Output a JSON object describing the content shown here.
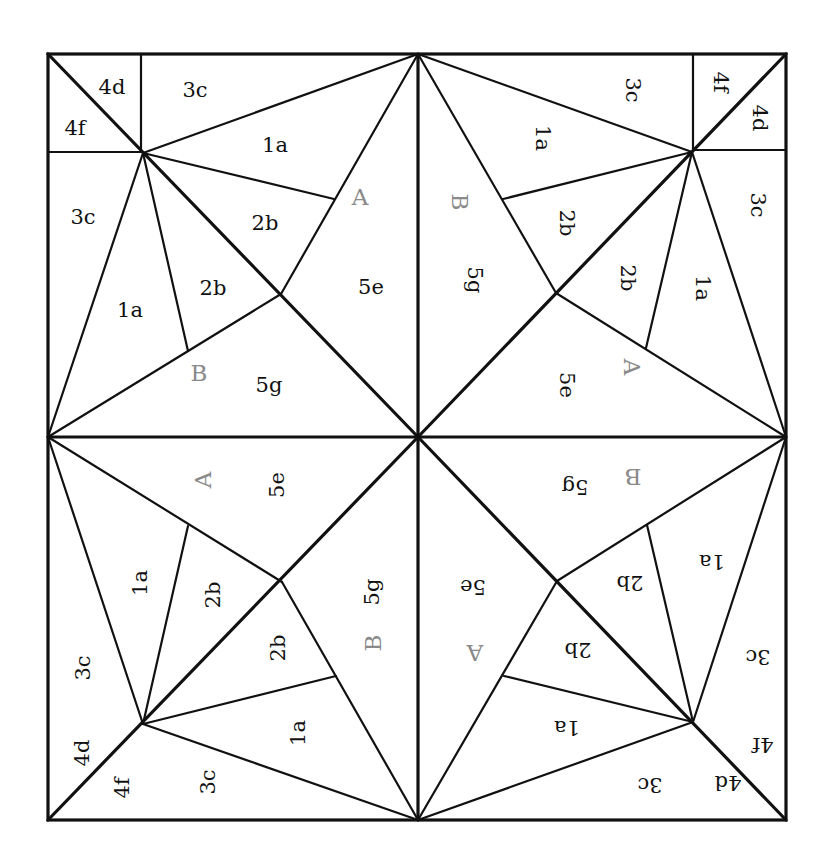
{
  "diagram": {
    "title": "",
    "colors": {
      "line": "#111111",
      "label": "#111111",
      "reference_label": "#8a8a8a",
      "background": "#ffffff"
    },
    "outer_square": {
      "left": 48,
      "top": 54,
      "right": 786,
      "bottom": 820
    },
    "center": [
      418,
      437
    ],
    "quadrants": [
      {
        "id": "top-left",
        "rotation": 0,
        "labels": [
          {
            "text": "4d",
            "x": 112,
            "y": 87
          },
          {
            "text": "4f",
            "x": 75,
            "y": 128
          },
          {
            "text": "3c",
            "x": 195,
            "y": 90
          },
          {
            "text": "1a",
            "x": 275,
            "y": 145
          },
          {
            "text": "A",
            "x": 360,
            "y": 197,
            "ref": true
          },
          {
            "text": "3c",
            "x": 83,
            "y": 217
          },
          {
            "text": "2b",
            "x": 265,
            "y": 223
          },
          {
            "text": "2b",
            "x": 213,
            "y": 288
          },
          {
            "text": "5e",
            "x": 371,
            "y": 287
          },
          {
            "text": "1a",
            "x": 130,
            "y": 310
          },
          {
            "text": "B",
            "x": 199,
            "y": 373,
            "ref": true
          },
          {
            "text": "5g",
            "x": 269,
            "y": 385
          }
        ]
      },
      {
        "id": "top-right",
        "rotation": 90,
        "labels": [
          {
            "text": "3c",
            "x": 633,
            "y": 90
          },
          {
            "text": "4f",
            "x": 721,
            "y": 82
          },
          {
            "text": "4d",
            "x": 760,
            "y": 118
          },
          {
            "text": "1a",
            "x": 543,
            "y": 138
          },
          {
            "text": "3c",
            "x": 758,
            "y": 205
          },
          {
            "text": "B",
            "x": 460,
            "y": 202,
            "ref": true
          },
          {
            "text": "2b",
            "x": 567,
            "y": 223
          },
          {
            "text": "5g",
            "x": 475,
            "y": 280
          },
          {
            "text": "2b",
            "x": 628,
            "y": 278
          },
          {
            "text": "1a",
            "x": 703,
            "y": 288
          },
          {
            "text": "A",
            "x": 632,
            "y": 367,
            "ref": true
          },
          {
            "text": "5e",
            "x": 567,
            "y": 385
          }
        ]
      },
      {
        "id": "bottom-left",
        "rotation": -90,
        "labels": [
          {
            "text": "A",
            "x": 203,
            "y": 480,
            "ref": true
          },
          {
            "text": "5e",
            "x": 277,
            "y": 485
          },
          {
            "text": "1a",
            "x": 140,
            "y": 583
          },
          {
            "text": "2b",
            "x": 213,
            "y": 595
          },
          {
            "text": "5g",
            "x": 372,
            "y": 592
          },
          {
            "text": "B",
            "x": 373,
            "y": 643,
            "ref": true
          },
          {
            "text": "2b",
            "x": 278,
            "y": 648
          },
          {
            "text": "3c",
            "x": 83,
            "y": 668
          },
          {
            "text": "1a",
            "x": 298,
            "y": 733
          },
          {
            "text": "4d",
            "x": 82,
            "y": 753
          },
          {
            "text": "4f",
            "x": 122,
            "y": 788
          },
          {
            "text": "3c",
            "x": 208,
            "y": 782
          }
        ]
      },
      {
        "id": "bottom-right",
        "rotation": 180,
        "labels": [
          {
            "text": "B",
            "x": 633,
            "y": 477,
            "ref": true
          },
          {
            "text": "5g",
            "x": 575,
            "y": 487
          },
          {
            "text": "1a",
            "x": 712,
            "y": 562
          },
          {
            "text": "2b",
            "x": 630,
            "y": 583
          },
          {
            "text": "5e",
            "x": 473,
            "y": 587
          },
          {
            "text": "2b",
            "x": 578,
            "y": 650
          },
          {
            "text": "A",
            "x": 475,
            "y": 653,
            "ref": true
          },
          {
            "text": "3c",
            "x": 758,
            "y": 657
          },
          {
            "text": "1a",
            "x": 567,
            "y": 728
          },
          {
            "text": "4f",
            "x": 763,
            "y": 745
          },
          {
            "text": "3c",
            "x": 650,
            "y": 785
          },
          {
            "text": "4d",
            "x": 728,
            "y": 783
          }
        ]
      }
    ]
  }
}
